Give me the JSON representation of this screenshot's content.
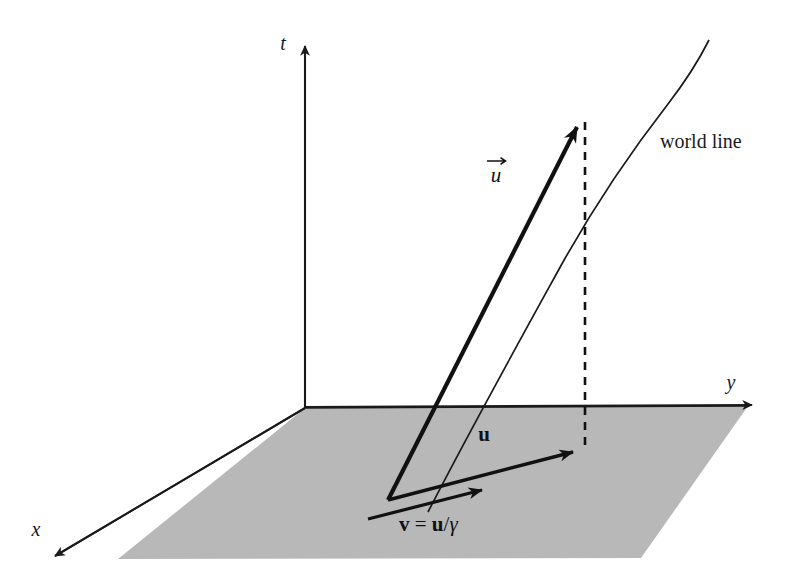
{
  "figure": {
    "background_color": "#ffffff",
    "ink_color": "#111111",
    "plane_fill_color": "#b8b8b8",
    "plane_edge_color": "#1a1a1a"
  },
  "axes": [
    {
      "id": "t",
      "label": "t",
      "label_x": 283,
      "label_y": 50,
      "description": "time axis pointing up"
    },
    {
      "id": "y",
      "label": "y",
      "label_x": 731,
      "label_y": 389,
      "description": "y axis pointing right"
    },
    {
      "id": "x",
      "label": "x",
      "label_x": 36,
      "label_y": 536,
      "description": "x axis pointing down-left out of the page"
    }
  ],
  "vectors": [
    {
      "id": "four-velocity",
      "label": "u",
      "accent": "arrow-over",
      "style": "italic-with-vector-arrow",
      "label_x": 496,
      "label_y": 182,
      "description": "four-velocity vector u, thick arrow rising from the event into the future"
    },
    {
      "id": "u-in-plane",
      "label": "u",
      "style": "bold-upright",
      "label_x": 484,
      "label_y": 441,
      "description": "spatial projection u lying in the shaded x-y plane"
    },
    {
      "id": "v-equation",
      "label_parts": [
        {
          "text": "v",
          "style": "bold"
        },
        {
          "text": " = ",
          "style": "plain"
        },
        {
          "text": "u",
          "style": "bold"
        },
        {
          "text": "/",
          "style": "plain"
        },
        {
          "text": "γ",
          "style": "italic"
        }
      ],
      "label_plain": "v = u/γ",
      "label_x": 399,
      "label_y": 531,
      "description": "three-velocity v equals u divided by gamma"
    }
  ],
  "annotations": [
    {
      "id": "world-line",
      "label": "world line",
      "label_x": 660,
      "label_y": 148,
      "description": "curved trajectory of the particle through spacetime"
    },
    {
      "id": "projection-line",
      "label": "",
      "style": "dashed-vertical",
      "description": "dashed vertical line dropping from the tip of the four-velocity to the spatial plane"
    }
  ]
}
